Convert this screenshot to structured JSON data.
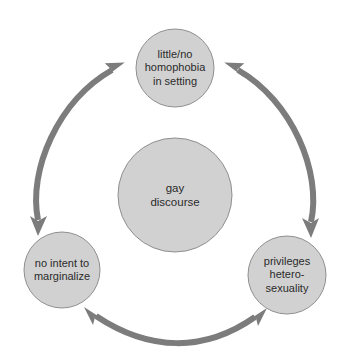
{
  "diagram": {
    "type": "cyclic-process-diagram",
    "title": "",
    "colors": {
      "background": "#ffffff",
      "circle_fill": "#d1d1d1",
      "circle_stroke": "#8f8f8f",
      "arrow": "#7c7c7c",
      "text": "#2b2b2b"
    },
    "center_node": {
      "id": "gay-discourse",
      "label": "gay\ndiscourse",
      "cx": 175,
      "cy": 195,
      "r": 57
    },
    "outer_nodes": [
      {
        "id": "little-no-homophobia",
        "label": "little/no\nhomophobia\nin setting",
        "cx": 175,
        "cy": 68,
        "r": 39,
        "position": "top"
      },
      {
        "id": "no-intent-to-marginalize",
        "label": "no intent to\nmarginalize",
        "cx": 62,
        "cy": 270,
        "r": 38,
        "position": "bottom-left"
      },
      {
        "id": "privileges-heterosexuality",
        "label": "privileges\nhetero-\nsexuality",
        "cx": 287,
        "cy": 275,
        "r": 39,
        "position": "bottom-right"
      }
    ],
    "connectors": [
      {
        "id": "arc-left",
        "from": "no-intent-to-marginalize",
        "to": "little-no-homophobia",
        "style": "curved-double-arrow",
        "heads": "both"
      },
      {
        "id": "arc-right",
        "from": "little-no-homophobia",
        "to": "privileges-heterosexuality",
        "style": "curved-double-arrow",
        "heads": "both"
      },
      {
        "id": "arc-bottom",
        "from": "no-intent-to-marginalize",
        "to": "privileges-heterosexuality",
        "style": "curved-double-arrow",
        "heads": "both"
      }
    ]
  }
}
